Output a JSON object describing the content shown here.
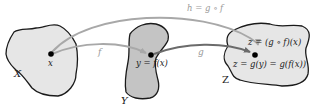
{
  "diagram": {
    "colors": {
      "set_x_fill": "#e6e6e6",
      "set_y_fill": "#c4c4c4",
      "set_z_fill": "#e6e6e6",
      "outline": "#1a1a1a",
      "arrow_f": "#a8a8a8",
      "arrow_g": "#6b6b6b",
      "arrow_h": "#a8a8a8",
      "point": "#000000",
      "label_light": "#9a9a9a",
      "text": "#222222"
    },
    "sets": [
      {
        "id": "X",
        "label": "X"
      },
      {
        "id": "Y",
        "label": "Y"
      },
      {
        "id": "Z",
        "label": "Z"
      }
    ],
    "points": {
      "x": {
        "label": "x"
      },
      "y": {
        "label": "y = f(x)"
      },
      "z": {
        "label_top": "z = (g ∘ f)(x)",
        "label_bottom": "z = g(y) = g(f(x))"
      }
    },
    "arrows": {
      "f": {
        "label": "f"
      },
      "g": {
        "label": "g"
      },
      "h": {
        "label": "h = g ∘ f"
      }
    }
  }
}
